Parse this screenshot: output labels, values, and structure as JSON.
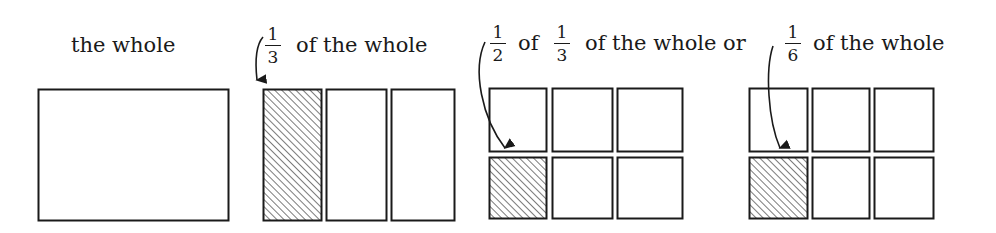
{
  "labels": {
    "whole": "the whole",
    "third": {
      "fraction": {
        "num": "1",
        "den": "3"
      },
      "text": "of the whole"
    },
    "half_of_third": {
      "frac_a": {
        "num": "1",
        "den": "2"
      },
      "of": "of",
      "frac_b": {
        "num": "1",
        "den": "3"
      },
      "text": "of the whole or"
    },
    "sixth": {
      "fraction": {
        "num": "1",
        "den": "6"
      },
      "text": "of the whole"
    }
  },
  "figures": [
    {
      "name": "whole",
      "parts": 1,
      "shaded": 0
    },
    {
      "name": "thirds",
      "parts": 3,
      "shaded": 1
    },
    {
      "name": "sixths-a",
      "parts": 6,
      "shaded": 1
    },
    {
      "name": "sixths-b",
      "parts": 6,
      "shaded": 1
    }
  ],
  "colors": {
    "stroke": "#1a1a1a",
    "hatch": "#333333",
    "background": "#ffffff"
  }
}
